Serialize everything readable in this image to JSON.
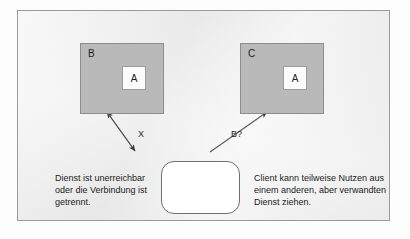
{
  "figure": {
    "background_color": "#eeeeee",
    "frame_border_color": "#9a9a9a",
    "box_fill_color": "#b9b9b9",
    "inner_box_fill_color": "#fcfcfc",
    "arrow_color": "#3a3a3a"
  },
  "nodes": {
    "box_b": {
      "label": "B",
      "inner_label": "A"
    },
    "box_c": {
      "label": "C",
      "inner_label": "A"
    },
    "client": {
      "label": ""
    }
  },
  "edges": {
    "left": {
      "label": "X",
      "style": "double-headed-arrow"
    },
    "right": {
      "label": "B?",
      "style": "single-headed-arrow"
    }
  },
  "captions": {
    "left": {
      "lines": [
        "Dienst ist unerreichbar",
        "oder die Verbindung ist",
        "getrennt."
      ]
    },
    "right": {
      "lines": [
        "Client kann teilweise Nutzen aus",
        "einem anderen, aber verwandten",
        "Dienst ziehen."
      ]
    }
  }
}
